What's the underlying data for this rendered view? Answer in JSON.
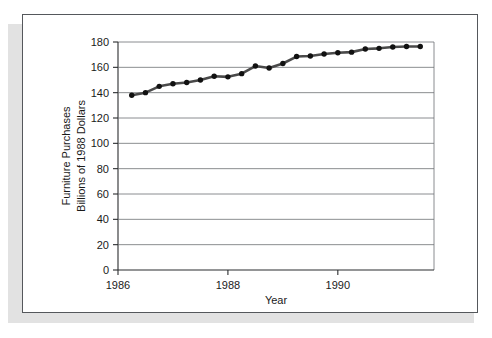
{
  "figure": {
    "background_color": "#ffffff",
    "frame_color": "#55585c",
    "shadow_color": "#e2e2e2"
  },
  "chart_data": {
    "type": "line",
    "title": "",
    "subtitle": "",
    "xlabel": "Year",
    "ylabel": "Furniture Purchases\nBillions of 1988 Dollars",
    "ylabel_line1": "Furniture Purchases",
    "ylabel_line2": "Billions of 1988 Dollars",
    "xlim": [
      1986.0,
      1991.75
    ],
    "ylim": [
      0,
      180
    ],
    "yticks": [
      0,
      20,
      40,
      60,
      80,
      100,
      120,
      140,
      160,
      180
    ],
    "ytick_labels": [
      "0",
      "20",
      "40",
      "60",
      "80",
      "100",
      "120",
      "140",
      "160",
      "180"
    ],
    "xticks": [
      1986,
      1988,
      1990
    ],
    "xtick_labels": [
      "1986",
      "1988",
      "1990"
    ],
    "grid": "horizontal",
    "legend": "none",
    "marker": "filled-circle",
    "line_color": "#4a4a4a",
    "marker_color": "#111111",
    "series": [
      {
        "name": "Furniture Purchases",
        "x": [
          1986.25,
          1986.5,
          1986.75,
          1987.0,
          1987.25,
          1987.5,
          1987.75,
          1988.0,
          1988.25,
          1988.5,
          1988.75,
          1989.0,
          1989.25,
          1989.5,
          1989.75,
          1990.0,
          1990.25,
          1990.5,
          1990.75,
          1991.0,
          1991.25,
          1991.5
        ],
        "values": [
          138,
          140,
          145,
          147,
          148,
          150,
          153,
          152.5,
          155,
          161,
          159.5,
          163,
          168.5,
          169,
          170.5,
          171.5,
          172,
          174.5,
          175,
          176,
          176.5,
          176.5
        ]
      }
    ]
  }
}
